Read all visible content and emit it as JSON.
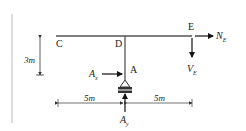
{
  "diagram": {
    "points": {
      "C": "C",
      "D": "D",
      "E": "E",
      "A": "A"
    },
    "forces": {
      "NE": {
        "main": "N",
        "sub": "E"
      },
      "VE": {
        "main": "V",
        "sub": "E"
      },
      "Ax": {
        "main": "A",
        "sub": "x"
      },
      "Ay": {
        "main": "A",
        "sub": "y"
      }
    },
    "dimensions": {
      "height": "3m",
      "left_span": "5m",
      "right_span": "5m"
    },
    "colors": {
      "line": "#333333",
      "frame": "#555555",
      "support_fill": "#888888"
    }
  }
}
